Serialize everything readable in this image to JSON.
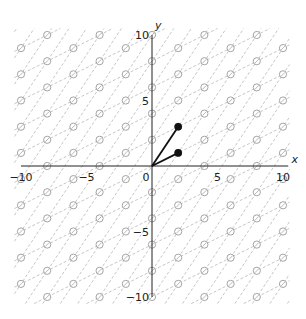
{
  "chart_data": {
    "type": "scatter",
    "title": "",
    "xlabel": "x",
    "ylabel": "y",
    "xlim": [
      -10,
      10
    ],
    "ylim": [
      -10,
      10
    ],
    "x_ticks": [
      -10,
      -5,
      0,
      5,
      10
    ],
    "y_ticks": [
      -10,
      -5,
      5,
      10
    ],
    "x_tick_labels": [
      "−10",
      "−5",
      "0",
      "5",
      "10"
    ],
    "y_tick_labels": [
      "−10",
      "−5",
      "5",
      "10"
    ],
    "grid": false,
    "legend": null,
    "basis_vectors": [
      {
        "name": "v1",
        "x": 2,
        "y": 1
      },
      {
        "name": "v2",
        "x": 2,
        "y": 3
      }
    ],
    "lattice": {
      "description": "Integer combinations of v1=(2,1) and v2=(2,3): points with even x; y even when x≡0 (mod 4), y odd when x≡2 (mod 4)",
      "marker": "open-circle",
      "grid_lines": "dashed lines along directions of v1 and v2 through lattice points"
    },
    "colors": {
      "axis": "#222222",
      "vector": "#111111",
      "lattice": "#9a9a9a",
      "dashed": "#b8b8b8"
    }
  }
}
